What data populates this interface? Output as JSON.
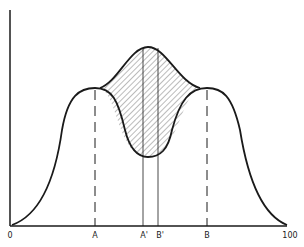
{
  "diagram": {
    "type": "distribution-curves",
    "x_labels": [
      {
        "id": "origin",
        "text": "0",
        "x": 10
      },
      {
        "id": "a",
        "text": "A",
        "x": 95
      },
      {
        "id": "a-prime",
        "text": "A'",
        "x": 143
      },
      {
        "id": "b-prime",
        "text": "B'",
        "x": 158
      },
      {
        "id": "b",
        "text": "B",
        "x": 207
      },
      {
        "id": "end",
        "text": "100",
        "x": 290
      }
    ],
    "colors": {
      "line": "#1a1a1a",
      "hatch": "#555555",
      "background": "#ffffff"
    }
  }
}
